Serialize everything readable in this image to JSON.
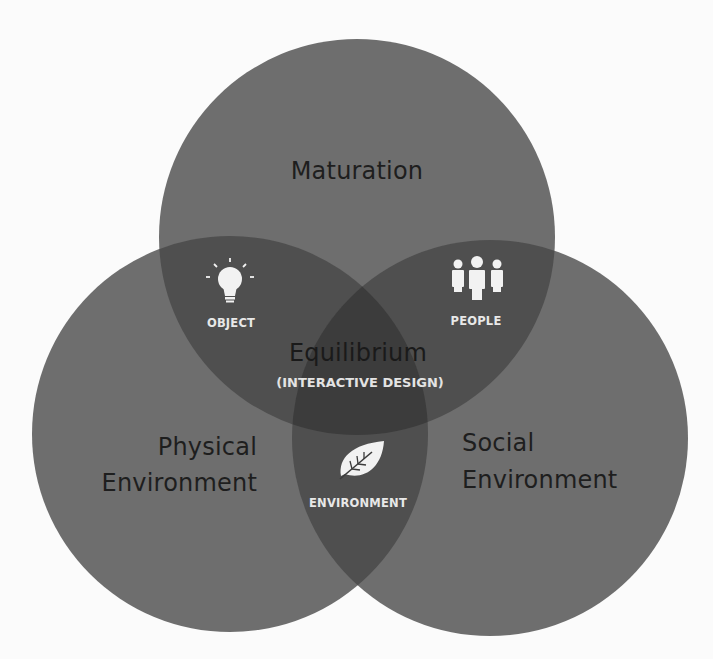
{
  "diagram": {
    "type": "venn",
    "colors": {
      "background": "#fbfbfb",
      "circle_fill": "#6e6e6e",
      "double_overlap": "#4f4f4f",
      "triple_overlap": "#3c3c3c",
      "dark_text": "#1e1e1e",
      "light_text": "#e8e8e8",
      "icon_fill": "#f2f2f2"
    },
    "circles": [
      {
        "id": "maturation",
        "label": "Maturation"
      },
      {
        "id": "physical",
        "label_line1": "Physical",
        "label_line2": "Environment"
      },
      {
        "id": "social",
        "label_line1": "Social",
        "label_line2": "Environment"
      }
    ],
    "overlaps": {
      "maturation_physical": {
        "label": "OBJECT",
        "icon": "lightbulb-icon"
      },
      "maturation_social": {
        "label": "PEOPLE",
        "icon": "people-icon"
      },
      "physical_social": {
        "label": "ENVIRONMENT",
        "icon": "leaf-icon"
      },
      "center": {
        "title": "Equilibrium",
        "subtitle": "(INTERACTIVE DESIGN)"
      }
    }
  }
}
